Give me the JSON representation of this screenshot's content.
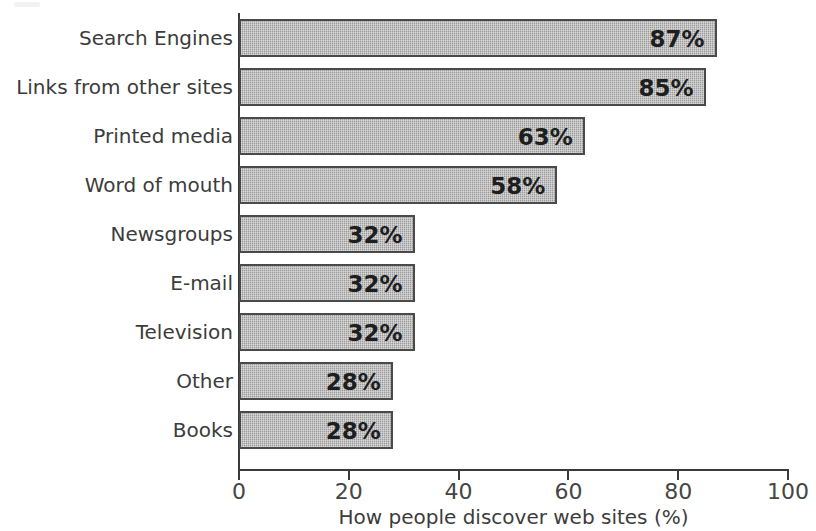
{
  "chart_data": {
    "type": "bar",
    "orientation": "horizontal",
    "title": "",
    "xlabel": "How people discover web sites (%)",
    "ylabel": "",
    "xlim": [
      0,
      100
    ],
    "xticks": [
      0,
      20,
      40,
      60,
      80,
      100
    ],
    "xtick_labels": [
      "0",
      "20",
      "40",
      "60",
      "80",
      "100"
    ],
    "grid": false,
    "legend": false,
    "categories": [
      "Search Engines",
      "Links from other sites",
      "Printed media",
      "Word of mouth",
      "Newsgroups",
      "E-mail",
      "Television",
      "Other",
      "Books"
    ],
    "values": [
      87,
      85,
      63,
      58,
      32,
      32,
      32,
      28,
      28
    ],
    "value_labels": [
      "87%",
      "85%",
      "63%",
      "58%",
      "32%",
      "32%",
      "32%",
      "28%",
      "28%"
    ],
    "bar_fill_color": "#a9a9a9",
    "bar_border_color": "#4a4a4a",
    "axis_color": "#3a3a3a",
    "text_color": "#3c3c3c",
    "background_color": "#ffffff"
  }
}
